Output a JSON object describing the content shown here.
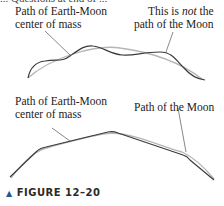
{
  "top_cut_text": "... Questions at end of ...",
  "panel_top": {
    "label_left_line1": "Path of Earth-Moon",
    "label_left_line2": "center of mass",
    "label_right_line1_pre": "This is ",
    "label_right_line1_em": "not",
    "label_right_line1_post": " the",
    "label_right_line2": "path of the Moon"
  },
  "panel_bottom": {
    "label_left_line1": "Path of Earth-Moon",
    "label_left_line2": "center of mass",
    "label_right": "Path of the Moon"
  },
  "caption": {
    "marker": "▲",
    "text": "FIGURE 12–20"
  },
  "colors": {
    "dark_path": "#3a3a3a",
    "light_path": "#b5b5b5",
    "leader": "#555555",
    "caption_marker": "#1f5c8f"
  }
}
